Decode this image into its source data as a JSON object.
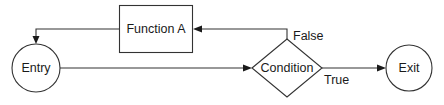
{
  "diagram": {
    "type": "flowchart",
    "colors": {
      "stroke": "#333333",
      "text": "#1a1a1a",
      "background": "#ffffff"
    },
    "nodes": {
      "entry": {
        "label": "Entry",
        "shape": "circle"
      },
      "function_a": {
        "label": "Function A",
        "shape": "rectangle"
      },
      "condition": {
        "label": "Condition",
        "shape": "diamond"
      },
      "exit": {
        "label": "Exit",
        "shape": "circle"
      }
    },
    "edges": [
      {
        "from": "entry",
        "to": "condition",
        "label": ""
      },
      {
        "from": "condition",
        "to": "exit",
        "label": "True"
      },
      {
        "from": "condition",
        "to": "function_a",
        "label": "False"
      },
      {
        "from": "function_a",
        "to": "entry",
        "label": ""
      }
    ],
    "edge_labels": {
      "true": "True",
      "false": "False"
    }
  }
}
